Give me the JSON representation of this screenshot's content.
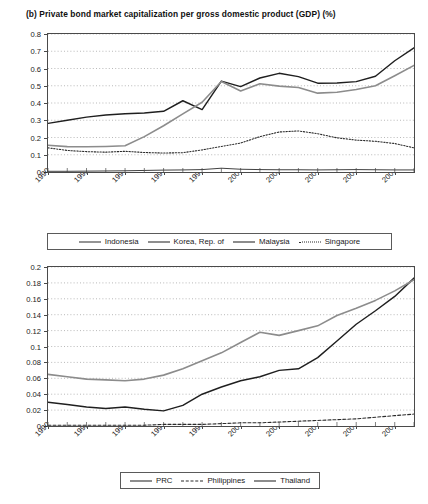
{
  "chart_data": [
    {
      "type": "line",
      "id": "private-bond-top",
      "title": "(b) Private bond market capitalization per gross domestic product (GDP) (%)",
      "xlabel": "",
      "ylabel": "",
      "grid": true,
      "legend_position": "bottom",
      "ylim": [
        0,
        0.8
      ],
      "yticks": [
        "0",
        "0.1",
        "0.2",
        "0.3",
        "0.4",
        "0.5",
        "0.6",
        "0.7",
        "0.8"
      ],
      "ytick_values": [
        0,
        0.1,
        0.2,
        0.3,
        0.4,
        0.5,
        0.6,
        0.7,
        0.8
      ],
      "xlim": [
        1990,
        2009
      ],
      "xticks": [
        "1990",
        "1992",
        "1994",
        "1996",
        "1998",
        "2000",
        "2002",
        "2004",
        "2006",
        "2008"
      ],
      "xtick_values": [
        1990,
        1992,
        1994,
        1996,
        1998,
        2000,
        2002,
        2004,
        2006,
        2008
      ],
      "x": [
        1990,
        1991,
        1992,
        1993,
        1994,
        1995,
        1996,
        1997,
        1998,
        1999,
        2000,
        2001,
        2002,
        2003,
        2004,
        2005,
        2006,
        2007,
        2008,
        2009
      ],
      "series": [
        {
          "name": "Indonesia",
          "style": "solid-thin-dark",
          "color": "#2b2b2b",
          "values": [
            0.004,
            0.004,
            0.005,
            0.006,
            0.007,
            0.009,
            0.011,
            0.012,
            0.014,
            0.022,
            0.016,
            0.014,
            0.013,
            0.013,
            0.012,
            0.013,
            0.014,
            0.013,
            0.012,
            0.012
          ]
        },
        {
          "name": "Korea, Rep. of",
          "style": "solid-thick-dark",
          "color": "#1f1f1f",
          "values": [
            0.282,
            0.3,
            0.318,
            0.33,
            0.338,
            0.342,
            0.352,
            0.413,
            0.362,
            0.527,
            0.495,
            0.545,
            0.572,
            0.553,
            0.515,
            0.516,
            0.524,
            0.555,
            0.645,
            0.72
          ]
        },
        {
          "name": "Malaysia",
          "style": "solid-thick-gray",
          "color": "#8c8c8c",
          "values": [
            0.155,
            0.147,
            0.146,
            0.148,
            0.152,
            0.205,
            0.268,
            0.337,
            0.404,
            0.525,
            0.47,
            0.512,
            0.498,
            0.49,
            0.457,
            0.462,
            0.478,
            0.5,
            0.558,
            0.618
          ]
        },
        {
          "name": "Singapore",
          "style": "dotted-dark",
          "color": "#2b2b2b",
          "values": [
            0.14,
            0.125,
            0.118,
            0.115,
            0.12,
            0.113,
            0.11,
            0.112,
            0.128,
            0.148,
            0.168,
            0.205,
            0.232,
            0.238,
            0.222,
            0.198,
            0.185,
            0.178,
            0.165,
            0.14
          ]
        }
      ]
    },
    {
      "type": "line",
      "id": "private-bond-bottom",
      "title": "",
      "xlabel": "",
      "ylabel": "",
      "grid": true,
      "legend_position": "bottom",
      "ylim": [
        0,
        0.2
      ],
      "yticks": [
        "0",
        "0.02",
        "0.04",
        "0.06",
        "0.08",
        "0.1",
        "0.12",
        "0.14",
        "0.16",
        "0.18",
        "0.2"
      ],
      "ytick_values": [
        0,
        0.02,
        0.04,
        0.06,
        0.08,
        0.1,
        0.12,
        0.14,
        0.16,
        0.18,
        0.2
      ],
      "xlim": [
        1990,
        2009
      ],
      "xticks": [
        "1990",
        "1992",
        "1994",
        "1996",
        "1998",
        "2000",
        "2002",
        "2004",
        "2006",
        "2008"
      ],
      "xtick_values": [
        1990,
        1992,
        1994,
        1996,
        1998,
        2000,
        2002,
        2004,
        2006,
        2008
      ],
      "x": [
        1990,
        1991,
        1992,
        1993,
        1994,
        1995,
        1996,
        1997,
        1998,
        1999,
        2000,
        2001,
        2002,
        2003,
        2004,
        2005,
        2006,
        2007,
        2008,
        2009
      ],
      "series": [
        {
          "name": "PRC",
          "style": "solid-thick-dark",
          "color": "#1f1f1f",
          "values": [
            0.03,
            0.027,
            0.024,
            0.022,
            0.024,
            0.021,
            0.019,
            0.026,
            0.04,
            0.049,
            0.057,
            0.062,
            0.07,
            0.072,
            0.086,
            0.107,
            0.128,
            0.145,
            0.163,
            0.186
          ]
        },
        {
          "name": "Philippines",
          "style": "dashed-dark",
          "color": "#2b2b2b",
          "values": [
            0.001,
            0.001,
            0.001,
            0.001,
            0.001,
            0.001,
            0.002,
            0.002,
            0.002,
            0.003,
            0.004,
            0.004,
            0.005,
            0.006,
            0.007,
            0.008,
            0.009,
            0.011,
            0.013,
            0.015
          ]
        },
        {
          "name": "Thailand",
          "style": "solid-thick-gray",
          "color": "#8c8c8c",
          "values": [
            0.065,
            0.062,
            0.059,
            0.058,
            0.057,
            0.059,
            0.064,
            0.072,
            0.082,
            0.092,
            0.105,
            0.118,
            0.114,
            0.12,
            0.126,
            0.139,
            0.148,
            0.158,
            0.17,
            0.184
          ]
        }
      ]
    }
  ]
}
